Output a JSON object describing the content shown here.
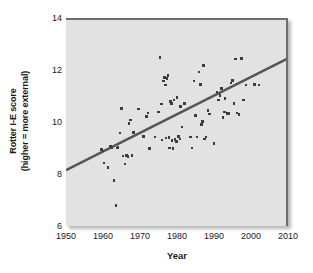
{
  "chart_data": {
    "type": "scatter",
    "title": "",
    "xlabel": "Year",
    "ylabel": "Rotter I-E score\n(higher = more external)",
    "ylabel_line1": "Rotter I-E score",
    "ylabel_line2": "(higher = more external)",
    "xlim": [
      1950,
      2010
    ],
    "ylim": [
      6,
      14
    ],
    "xticks": [
      1950,
      1960,
      1970,
      1980,
      1990,
      2000,
      2010
    ],
    "yticks": [
      6,
      8,
      10,
      12,
      14
    ],
    "grid": false,
    "legend": "none",
    "plot_background_color": "#e2e2e2",
    "point_color": "#3c3c3c",
    "trend_line_color": "#555555",
    "trend_line": {
      "x": [
        1950,
        2010
      ],
      "y": [
        8.15,
        12.45
      ],
      "label": "linear regression fit"
    },
    "points": [
      [
        1959.6,
        8.95
      ],
      [
        1960.0,
        8.88
      ],
      [
        1960.3,
        8.42
      ],
      [
        1961.4,
        8.25
      ],
      [
        1962.0,
        9.08
      ],
      [
        1962.4,
        9.0
      ],
      [
        1963.0,
        7.75
      ],
      [
        1963.5,
        6.78
      ],
      [
        1963.8,
        9.0
      ],
      [
        1964.1,
        9.02
      ],
      [
        1964.6,
        9.58
      ],
      [
        1965.0,
        10.52
      ],
      [
        1965.4,
        8.7
      ],
      [
        1965.9,
        8.38
      ],
      [
        1966.3,
        8.72
      ],
      [
        1966.8,
        8.68
      ],
      [
        1967.0,
        9.95
      ],
      [
        1967.4,
        10.08
      ],
      [
        1967.8,
        8.72
      ],
      [
        1968.2,
        9.6
      ],
      [
        1969.6,
        10.5
      ],
      [
        1971.0,
        9.45
      ],
      [
        1971.8,
        10.22
      ],
      [
        1972.2,
        10.35
      ],
      [
        1972.6,
        8.98
      ],
      [
        1974.0,
        9.42
      ],
      [
        1975.0,
        10.38
      ],
      [
        1975.4,
        12.48
      ],
      [
        1975.8,
        10.7
      ],
      [
        1976.0,
        9.3
      ],
      [
        1976.4,
        11.58
      ],
      [
        1976.7,
        11.72
      ],
      [
        1976.9,
        11.42
      ],
      [
        1977.0,
        9.38
      ],
      [
        1977.3,
        11.68
      ],
      [
        1977.6,
        11.78
      ],
      [
        1977.8,
        9.4
      ],
      [
        1978.0,
        9.0
      ],
      [
        1978.2,
        10.78
      ],
      [
        1978.5,
        10.72
      ],
      [
        1978.7,
        9.28
      ],
      [
        1978.9,
        8.98
      ],
      [
        1979.2,
        10.85
      ],
      [
        1979.5,
        9.32
      ],
      [
        1979.8,
        9.25
      ],
      [
        1980.0,
        10.95
      ],
      [
        1980.4,
        9.45
      ],
      [
        1980.8,
        9.35
      ],
      [
        1981.0,
        10.6
      ],
      [
        1981.4,
        9.8
      ],
      [
        1982.0,
        10.72
      ],
      [
        1983.6,
        9.42
      ],
      [
        1984.0,
        9.0
      ],
      [
        1984.6,
        11.58
      ],
      [
        1985.0,
        10.25
      ],
      [
        1985.4,
        9.42
      ],
      [
        1986.0,
        11.92
      ],
      [
        1986.4,
        11.45
      ],
      [
        1986.6,
        9.9
      ],
      [
        1986.9,
        10.02
      ],
      [
        1987.2,
        12.18
      ],
      [
        1987.5,
        9.35
      ],
      [
        1987.8,
        9.42
      ],
      [
        1988.4,
        10.45
      ],
      [
        1988.8,
        10.3
      ],
      [
        1990.0,
        9.18
      ],
      [
        1990.8,
        11.15
      ],
      [
        1991.2,
        10.85
      ],
      [
        1991.6,
        11.02
      ],
      [
        1992.0,
        11.28
      ],
      [
        1992.4,
        10.18
      ],
      [
        1992.8,
        10.38
      ],
      [
        1993.0,
        10.9
      ],
      [
        1993.6,
        10.32
      ],
      [
        1994.0,
        10.32
      ],
      [
        1994.6,
        11.5
      ],
      [
        1995.0,
        11.6
      ],
      [
        1995.4,
        10.72
      ],
      [
        1995.8,
        12.42
      ],
      [
        1996.2,
        10.35
      ],
      [
        1996.8,
        10.28
      ],
      [
        1997.4,
        12.45
      ],
      [
        1998.0,
        10.85
      ],
      [
        1998.6,
        11.42
      ],
      [
        2001.0,
        11.45
      ],
      [
        2002.2,
        11.42
      ]
    ]
  }
}
